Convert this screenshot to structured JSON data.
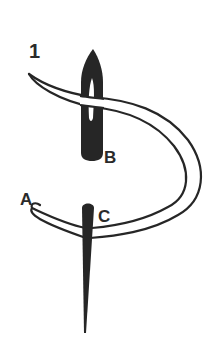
{
  "figure": {
    "step_number": "1",
    "labels": {
      "a": "A",
      "b": "B",
      "c": "C"
    },
    "colors": {
      "ink": "#262626",
      "background": "#ffffff"
    }
  }
}
